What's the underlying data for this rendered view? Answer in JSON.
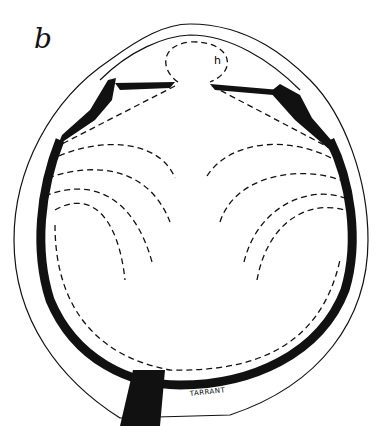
{
  "figure": {
    "panel_label": "b",
    "labels": {
      "h": "h",
      "signature": "TARRANT"
    },
    "colors": {
      "ink": "#111111",
      "background": "#ffffff"
    }
  }
}
